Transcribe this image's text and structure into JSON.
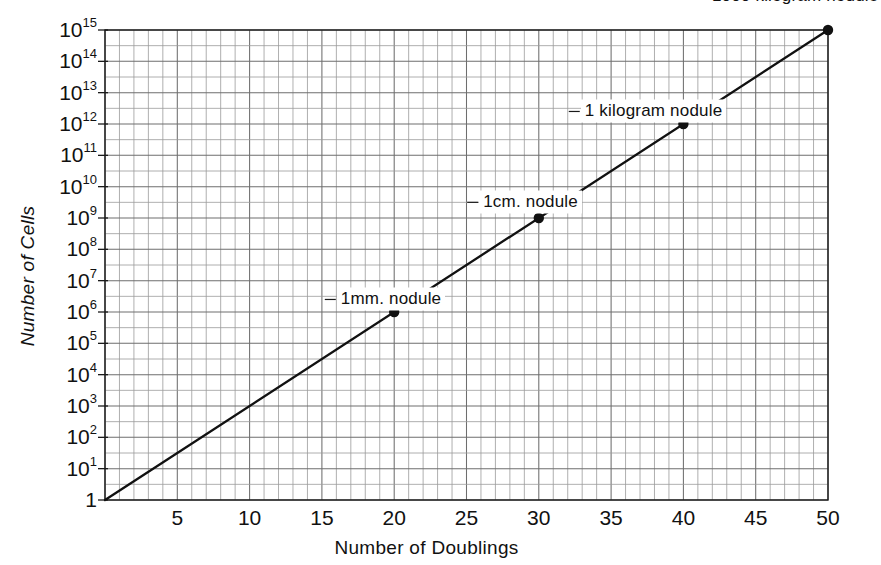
{
  "chart_data": {
    "type": "line",
    "title": "",
    "xlabel": "Number of Doublings",
    "ylabel": "Number of Cells",
    "xlim": [
      0,
      50
    ],
    "ylim": [
      1,
      1000000000000000
    ],
    "yscale": "log",
    "xscale": "linear",
    "grid": true,
    "legend": "none",
    "x_ticks": [
      {
        "value": 5,
        "label": "5"
      },
      {
        "value": 10,
        "label": "10"
      },
      {
        "value": 15,
        "label": "15"
      },
      {
        "value": 20,
        "label": "20"
      },
      {
        "value": 25,
        "label": "25"
      },
      {
        "value": 30,
        "label": "30"
      },
      {
        "value": 35,
        "label": "35"
      },
      {
        "value": 40,
        "label": "40"
      },
      {
        "value": 45,
        "label": "45"
      },
      {
        "value": 50,
        "label": "50"
      }
    ],
    "y_ticks": [
      {
        "exponent": 15,
        "mantissa": "10",
        "exp_label": "15"
      },
      {
        "exponent": 14,
        "mantissa": "10",
        "exp_label": "14"
      },
      {
        "exponent": 13,
        "mantissa": "10",
        "exp_label": "13"
      },
      {
        "exponent": 12,
        "mantissa": "10",
        "exp_label": "12"
      },
      {
        "exponent": 11,
        "mantissa": "10",
        "exp_label": "11"
      },
      {
        "exponent": 10,
        "mantissa": "10",
        "exp_label": "10"
      },
      {
        "exponent": 9,
        "mantissa": "10",
        "exp_label": "9"
      },
      {
        "exponent": 8,
        "mantissa": "10",
        "exp_label": "8"
      },
      {
        "exponent": 7,
        "mantissa": "10",
        "exp_label": "7"
      },
      {
        "exponent": 6,
        "mantissa": "10",
        "exp_label": "6"
      },
      {
        "exponent": 5,
        "mantissa": "10",
        "exp_label": "5"
      },
      {
        "exponent": 4,
        "mantissa": "10",
        "exp_label": "4"
      },
      {
        "exponent": 3,
        "mantissa": "10",
        "exp_label": "3"
      },
      {
        "exponent": 2,
        "mantissa": "10",
        "exp_label": "2"
      },
      {
        "exponent": 1,
        "mantissa": "10",
        "exp_label": "1"
      },
      {
        "exponent": 0,
        "mantissa": "1",
        "exp_label": ""
      }
    ],
    "series": [
      {
        "name": "cell doubling",
        "x": [
          0,
          50
        ],
        "y_exponent": [
          0,
          15
        ],
        "comment_points": [
          {
            "x": 0,
            "y_exponent": 0
          },
          {
            "x": 50,
            "y_exponent": 15
          }
        ]
      }
    ],
    "points": [
      {
        "x": 20,
        "y_exponent": 6,
        "label": "1mm. nodule",
        "label_x": 23.5,
        "label_exponent": 6.4,
        "anchor": "right"
      },
      {
        "x": 30,
        "y_exponent": 9,
        "label": "1cm. nodule",
        "label_x": 33.0,
        "label_exponent": 9.5,
        "anchor": "right"
      },
      {
        "x": 40,
        "y_exponent": 12,
        "label": "1 kilogram nodule",
        "label_x": 43.0,
        "label_exponent": 12.4,
        "anchor": "right"
      },
      {
        "x": 50,
        "y_exponent": 15,
        "label": "1000 kilogram nodule",
        "label_x": 52.0,
        "label_exponent": 16.1,
        "anchor": "right"
      }
    ],
    "colors": {
      "line": "#111111",
      "point": "#111111",
      "grid_major": "#6e6e6e",
      "grid_minor": "#9a9a9a",
      "axis": "#1a1a1a",
      "background": "#ffffff",
      "text": "#111111"
    },
    "geometry": {
      "plot_left": 105,
      "plot_right": 828,
      "plot_top": 30,
      "plot_bottom": 500,
      "x_minor_step": 1,
      "y_minor_per_decade": 2
    }
  }
}
